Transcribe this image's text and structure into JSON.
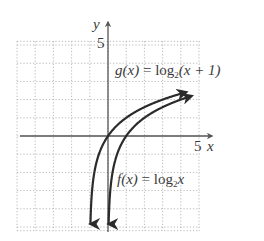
{
  "chart_data": {
    "type": "line",
    "title": "",
    "xlabel": "x",
    "ylabel": "y",
    "xlim": [
      -5,
      5
    ],
    "ylim": [
      -5,
      5
    ],
    "grid": true,
    "grid_style": "dotted",
    "grid_step": 1,
    "tick_labels": {
      "x": [
        "5"
      ],
      "y": [
        "5"
      ]
    },
    "series": [
      {
        "name": "g(x) = log2(x + 1)",
        "function": "log2(x+1)",
        "x": [
          -0.97,
          -0.9,
          -0.75,
          -0.5,
          0,
          0.5,
          1,
          2,
          3,
          4.3
        ],
        "y": [
          -5.06,
          -3.32,
          -2.0,
          -1.0,
          0,
          0.58,
          1.0,
          1.58,
          2.0,
          2.32
        ],
        "arrows": "both"
      },
      {
        "name": "f(x) = log2x",
        "function": "log2(x)",
        "x": [
          0.03,
          0.1,
          0.25,
          0.5,
          1,
          2,
          3,
          4,
          4.6
        ],
        "y": [
          -5.06,
          -3.32,
          -2.0,
          -1.0,
          0,
          1.0,
          1.58,
          2.0,
          2.2
        ],
        "arrows": "both"
      }
    ],
    "annotations": [
      {
        "text": "g(x) = log2(x + 1)",
        "near": "upper right, above curve g"
      },
      {
        "text": "f(x) = log2x",
        "near": "lower right of curve f"
      }
    ]
  },
  "labels": {
    "y_axis": "y",
    "x_axis": "x",
    "y_tick_5": "5",
    "x_tick_5": "5",
    "g": {
      "lhs": "g(x)",
      "eq": "=",
      "log": "log",
      "base": "2",
      "arg": "(x + 1)"
    },
    "f": {
      "lhs": "f(x)",
      "eq": "=",
      "log": "log",
      "base": "2",
      "arg": "x"
    }
  },
  "colors": {
    "axis": "#555555",
    "grid": "#b8b8b8",
    "curve": "#2b2b2b",
    "text": "#3a3a3a"
  }
}
